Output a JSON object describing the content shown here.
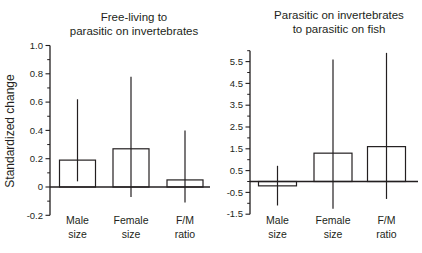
{
  "figure": {
    "ylabel": "Standardized change"
  },
  "chart_data": [
    {
      "type": "bar",
      "title": "Free-living to parasitic on invertebrates",
      "title_lines": [
        "Free-living to",
        "parasitic on invertebrates"
      ],
      "ylabel": "Standardized change",
      "categories": [
        "Male size",
        "Female size",
        "F/M ratio"
      ],
      "category_lines": [
        [
          "Male",
          "size"
        ],
        [
          "Female",
          "size"
        ],
        [
          "F/M",
          "ratio"
        ]
      ],
      "values": [
        0.19,
        0.27,
        0.05
      ],
      "ci_low": [
        0.04,
        -0.07,
        -0.11
      ],
      "ci_high": [
        0.62,
        0.78,
        0.4
      ],
      "ylim": [
        -0.2,
        1.0
      ],
      "yticks": [
        1.0,
        0.8,
        0.6,
        0.4,
        0.2,
        0,
        -0.2
      ],
      "ytick_labels": [
        "1.0",
        "0.8",
        "0.6",
        "0.4",
        "0.2",
        "0",
        "-0.2"
      ],
      "yticks_minor": [
        0.9,
        0.7,
        0.5,
        0.3,
        0.1,
        -0.1
      ],
      "legend": "none",
      "grid": false,
      "bar_fill": "#ffffff",
      "stroke": "#231f20"
    },
    {
      "type": "bar",
      "title": "Parasitic on invertebrates to parasitic on fish",
      "title_lines": [
        "Parasitic on invertebrates",
        "to parasitic on fish"
      ],
      "ylabel": "Standardized change",
      "categories": [
        "Male size",
        "Female size",
        "F/M ratio"
      ],
      "category_lines": [
        [
          "Male",
          "size"
        ],
        [
          "Female",
          "size"
        ],
        [
          "F/M",
          "ratio"
        ]
      ],
      "values": [
        -0.2,
        1.3,
        1.6
      ],
      "ci_low": [
        -1.1,
        -1.25,
        -0.8
      ],
      "ci_high": [
        0.72,
        5.6,
        5.9
      ],
      "ylim": [
        -1.5,
        6.0
      ],
      "yticks": [
        5.5,
        4.5,
        3.5,
        2.5,
        1.5,
        0.5,
        -0.5,
        -1.5
      ],
      "ytick_labels": [
        "5.5",
        "4.5",
        "3.5",
        "2.5",
        "1.5",
        "0.5",
        "-0.5",
        "-1.5"
      ],
      "yticks_minor": [
        6.0,
        5.0,
        4.0,
        3.0,
        2.0,
        1.0,
        0,
        -1.0
      ],
      "legend": "none",
      "grid": false,
      "bar_fill": "#ffffff",
      "stroke": "#231f20"
    }
  ]
}
